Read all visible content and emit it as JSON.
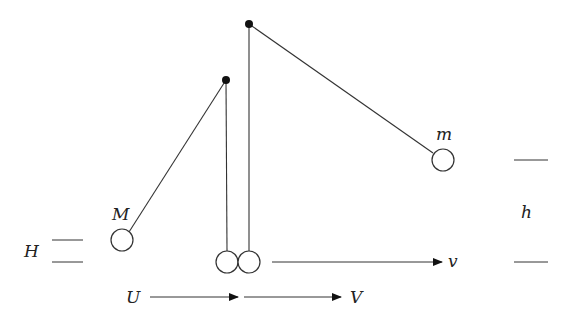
{
  "diagram": {
    "type": "physics-pendulum-collision",
    "colors": {
      "stroke": "#333333",
      "pivot": "#111111",
      "background": "#ffffff"
    },
    "labels": {
      "M": "M",
      "m": "m",
      "H": "H",
      "h": "h",
      "U": "U",
      "V": "V",
      "v": "v"
    },
    "pivots": [
      {
        "id": "pivot-small",
        "x": 226,
        "y": 80
      },
      {
        "id": "pivot-large",
        "x": 249,
        "y": 24
      }
    ],
    "balls": [
      {
        "id": "ball-M-raised",
        "x": 122,
        "y": 240,
        "r": 11
      },
      {
        "id": "ball-M-bottom",
        "x": 227,
        "y": 262,
        "r": 11
      },
      {
        "id": "ball-m-bottom",
        "x": 249,
        "y": 262,
        "r": 11
      },
      {
        "id": "ball-m-raised",
        "x": 443,
        "y": 160,
        "r": 11
      }
    ],
    "arrows": [
      {
        "id": "arrow-U",
        "x1": 150,
        "y1": 297,
        "x2": 238,
        "y2": 297
      },
      {
        "id": "arrow-V",
        "x1": 244,
        "y1": 297,
        "x2": 341,
        "y2": 297
      },
      {
        "id": "arrow-v",
        "x1": 272,
        "y1": 262,
        "x2": 442,
        "y2": 262
      }
    ]
  }
}
